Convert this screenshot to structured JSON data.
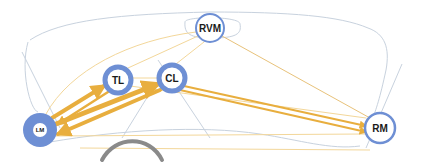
{
  "diagram": {
    "type": "gaze-transition-network",
    "colors": {
      "node_ring": "#6e8fd4",
      "node_fill": "#ffffff",
      "node_fill_filled": "#6e8fd4",
      "edge": "#e8ae3e",
      "edge_light": "#f3d79a",
      "outline": "#c8d2de",
      "steering": "#8a8a8a"
    },
    "nodes": [
      {
        "id": "RVM",
        "label": "RVM",
        "x": 210,
        "y": 28,
        "r": 14,
        "ring": 2,
        "filled": false
      },
      {
        "id": "TL",
        "label": "TL",
        "x": 118,
        "y": 80,
        "r": 14,
        "ring": 5,
        "filled": false
      },
      {
        "id": "CL",
        "label": "CL",
        "x": 172,
        "y": 78,
        "r": 14,
        "ring": 5,
        "filled": false
      },
      {
        "id": "LM",
        "label": "LM",
        "x": 40,
        "y": 130,
        "r": 17,
        "ring": 0,
        "filled": true
      },
      {
        "id": "RM",
        "label": "RM",
        "x": 380,
        "y": 128,
        "r": 15,
        "ring": 2,
        "filled": false
      }
    ],
    "edges": [
      {
        "from": "LM",
        "to": "TL",
        "weight": 5
      },
      {
        "from": "TL",
        "to": "LM",
        "weight": 3
      },
      {
        "from": "LM",
        "to": "CL",
        "weight": 6
      },
      {
        "from": "CL",
        "to": "LM",
        "weight": 5
      },
      {
        "from": "CL",
        "to": "RM",
        "weight": 3
      },
      {
        "from": "TL",
        "to": "RM",
        "weight": 2
      },
      {
        "from": "LM",
        "to": "RM",
        "weight": 1
      },
      {
        "from": "RVM",
        "to": "RM",
        "weight": 1
      },
      {
        "from": "RVM",
        "to": "TL",
        "weight": 1
      },
      {
        "from": "RVM",
        "to": "LM",
        "weight": 1
      },
      {
        "from": "CL",
        "to": "RVM",
        "weight": 1
      },
      {
        "from": "TL",
        "to": "CL",
        "weight": 1
      }
    ]
  }
}
